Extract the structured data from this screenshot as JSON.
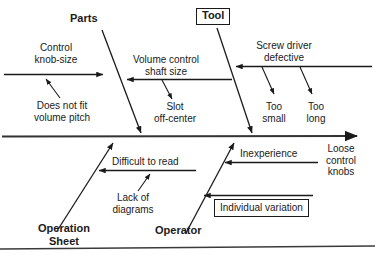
{
  "diagram": {
    "type": "fishbone-ishikawa",
    "title_effect": "Loose control knobs",
    "spine": {
      "y": 136,
      "x_start": 2,
      "x_end": 360,
      "arrow": "right"
    },
    "categories": [
      {
        "name": "Parts",
        "position": "top-left",
        "label": "Parts",
        "causes": [
          {
            "label_line1": "Control",
            "label_line2": "knob-size",
            "sub": {
              "line1": "Does not fit",
              "line2": "volume pitch"
            }
          },
          {
            "label_line1": "Volume control",
            "label_line2": "shaft size",
            "sub": {
              "line1": "Slot",
              "line2": "off-center"
            }
          }
        ]
      },
      {
        "name": "Tool",
        "position": "top-right",
        "label": "Tool",
        "boxed": true,
        "causes": [
          {
            "label_line1": "Screw driver",
            "label_line2": "defective",
            "subs": [
              {
                "line1": "Too",
                "line2": "small"
              },
              {
                "line1": "Too",
                "line2": "long"
              }
            ]
          }
        ]
      },
      {
        "name": "Operation Sheet",
        "position": "bottom-left",
        "label_line1": "Operation",
        "label_line2": "Sheet",
        "causes": [
          {
            "label": "Difficult to read",
            "sub": {
              "line1": "Lack of",
              "line2": "diagrams"
            }
          }
        ]
      },
      {
        "name": "Operator",
        "position": "bottom-right",
        "label": "Operator",
        "causes": [
          {
            "label": "Inexperience"
          },
          {
            "label": "Individual variation",
            "boxed": true
          }
        ]
      }
    ],
    "effect_lines": [
      "Loose",
      "control",
      "knobs"
    ],
    "colors": {
      "line": "#1a1a1a",
      "text": "#1a1a1a",
      "background": "#ffffff"
    }
  }
}
